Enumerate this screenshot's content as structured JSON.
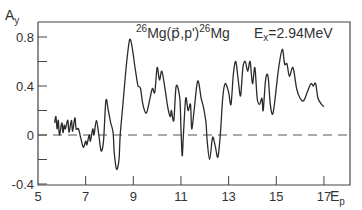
{
  "chart_data": {
    "type": "line",
    "title_parts": {
      "target_mass": "26",
      "reaction": "Mg(p⃗,p')",
      "product_mass": "26",
      "product": "Mg",
      "energy_label_main": "E",
      "energy_label_sub": "x",
      "energy_value": "=2.94MeV"
    },
    "xlabel": "Ep",
    "xlabel_main": "E",
    "xlabel_sub": "p",
    "ylabel": "Ay",
    "ylabel_main": "A",
    "ylabel_sub": "y",
    "xlim": [
      5,
      17.5
    ],
    "ylim": [
      -0.4,
      0.9
    ],
    "x_ticks": [
      "5",
      "7",
      "9",
      "11",
      "13",
      "15",
      "17"
    ],
    "y_ticks": [
      "0.8",
      "0.4",
      "0",
      "-0.4"
    ],
    "reference_line": {
      "y": 0,
      "style": "dashed"
    },
    "grid": false,
    "series": [
      {
        "name": "Ay",
        "x": [
          5.7,
          5.75,
          5.8,
          5.85,
          5.9,
          6.0,
          6.05,
          6.1,
          6.15,
          6.25,
          6.3,
          6.4,
          6.45,
          6.55,
          6.6,
          6.7,
          6.8,
          6.9,
          7.0,
          7.05,
          7.15,
          7.2,
          7.3,
          7.35,
          7.45,
          7.55,
          7.65,
          7.75,
          7.85,
          7.95,
          8.05,
          8.15,
          8.2,
          8.3,
          8.4,
          8.45,
          8.55,
          8.65,
          8.75,
          8.85,
          8.95,
          9.05,
          9.15,
          9.2,
          9.3,
          9.4,
          9.55,
          9.7,
          9.8,
          9.9,
          10.0,
          10.1,
          10.2,
          10.35,
          10.45,
          10.55,
          10.6,
          10.7,
          10.8,
          10.95,
          11.0,
          11.05,
          11.1,
          11.2,
          11.3,
          11.4,
          11.45,
          11.55,
          11.7,
          11.85,
          11.95,
          12.05,
          12.1,
          12.2,
          12.3,
          12.35,
          12.45,
          12.55,
          12.65,
          12.75,
          12.85,
          13.0,
          13.1,
          13.2,
          13.3,
          13.4,
          13.5,
          13.6,
          13.7,
          13.8,
          13.9,
          14.0,
          14.1,
          14.2,
          14.3,
          14.4,
          14.45,
          14.55,
          14.65,
          14.75,
          14.85,
          14.95,
          15.1,
          15.25,
          15.35,
          15.45,
          15.55,
          15.7,
          15.85,
          16.0,
          16.15,
          16.3,
          16.45,
          16.55,
          16.65,
          16.75,
          16.9,
          17.0
        ],
        "values": [
          0.1,
          0.15,
          0.05,
          0.12,
          0.0,
          0.1,
          0.02,
          0.08,
          0.05,
          0.12,
          0.02,
          0.12,
          0.03,
          0.14,
          0.05,
          0.05,
          -0.03,
          -0.1,
          -0.05,
          -0.08,
          0.0,
          -0.05,
          0.05,
          0.0,
          0.12,
          0.0,
          -0.13,
          -0.05,
          0.28,
          0.2,
          0.1,
          0.02,
          -0.15,
          -0.28,
          -0.2,
          0.0,
          0.22,
          0.45,
          0.65,
          0.78,
          0.72,
          0.58,
          0.45,
          0.4,
          0.38,
          0.25,
          0.18,
          0.3,
          0.38,
          0.35,
          0.55,
          0.45,
          0.52,
          0.35,
          0.22,
          0.15,
          0.2,
          0.12,
          0.4,
          0.3,
          0.05,
          -0.17,
          0.0,
          0.3,
          0.2,
          0.25,
          0.05,
          0.2,
          0.44,
          0.3,
          0.22,
          0.1,
          -0.05,
          -0.2,
          -0.05,
          -0.02,
          -0.1,
          -0.18,
          0.0,
          0.3,
          0.42,
          0.35,
          0.25,
          0.5,
          0.6,
          0.45,
          0.32,
          0.55,
          0.6,
          0.52,
          0.6,
          0.42,
          0.55,
          0.3,
          0.25,
          0.3,
          0.2,
          0.45,
          0.48,
          0.25,
          0.17,
          0.3,
          0.55,
          0.7,
          0.58,
          0.58,
          0.48,
          0.55,
          0.38,
          0.3,
          0.28,
          0.35,
          0.42,
          0.4,
          0.42,
          0.3,
          0.25,
          0.23
        ]
      }
    ]
  },
  "layout": {
    "plot_left": 38,
    "plot_right": 350,
    "plot_top": 22,
    "plot_bottom": 185,
    "x0_val": 5,
    "x_px_per_unit": 23.83,
    "y_zero_px": 135,
    "y_px_per_unit": 122.5
  },
  "colors": {
    "line": "#2a2a2a",
    "axis": "#444444",
    "dash": "#555555",
    "background": "#ffffff"
  }
}
